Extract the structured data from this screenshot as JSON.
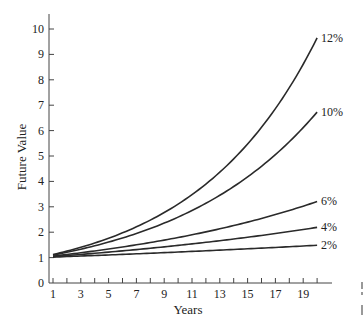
{
  "chart_data": {
    "type": "line",
    "title": "",
    "xlabel": "Years",
    "ylabel": "Future Value",
    "xlim": [
      1,
      20
    ],
    "ylim": [
      0,
      10
    ],
    "grid": false,
    "legend": "inline labels at right end of each curve",
    "x_tick_labels": [
      "1",
      "3",
      "5",
      "7",
      "9",
      "11",
      "13",
      "15",
      "17",
      "19"
    ],
    "y_tick_labels": [
      "0",
      "1",
      "2",
      "3",
      "4",
      "5",
      "6",
      "7",
      "8",
      "9",
      "10"
    ],
    "x": [
      1,
      2,
      3,
      4,
      5,
      6,
      7,
      8,
      9,
      10,
      11,
      12,
      13,
      14,
      15,
      16,
      17,
      18,
      19,
      20
    ],
    "series": [
      {
        "name": "12%",
        "rate": 0.12,
        "values": [
          1.12,
          1.25,
          1.4,
          1.57,
          1.76,
          1.97,
          2.21,
          2.48,
          2.77,
          3.11,
          3.48,
          3.9,
          4.36,
          4.89,
          5.47,
          6.13,
          6.87,
          7.69,
          8.61,
          9.65
        ]
      },
      {
        "name": "10%",
        "rate": 0.1,
        "values": [
          1.1,
          1.21,
          1.33,
          1.46,
          1.61,
          1.77,
          1.95,
          2.14,
          2.36,
          2.59,
          2.85,
          3.14,
          3.45,
          3.8,
          4.18,
          4.59,
          5.05,
          5.56,
          6.12,
          6.73
        ]
      },
      {
        "name": "6%",
        "rate": 0.06,
        "values": [
          1.06,
          1.12,
          1.19,
          1.26,
          1.34,
          1.42,
          1.5,
          1.59,
          1.69,
          1.79,
          1.9,
          2.01,
          2.13,
          2.26,
          2.4,
          2.54,
          2.69,
          2.85,
          3.03,
          3.21
        ]
      },
      {
        "name": "4%",
        "rate": 0.04,
        "values": [
          1.04,
          1.08,
          1.12,
          1.17,
          1.22,
          1.27,
          1.32,
          1.37,
          1.42,
          1.48,
          1.54,
          1.6,
          1.67,
          1.73,
          1.8,
          1.87,
          1.95,
          2.03,
          2.11,
          2.19
        ]
      },
      {
        "name": "2%",
        "rate": 0.02,
        "values": [
          1.02,
          1.04,
          1.06,
          1.08,
          1.1,
          1.13,
          1.15,
          1.17,
          1.2,
          1.22,
          1.24,
          1.27,
          1.29,
          1.32,
          1.35,
          1.37,
          1.4,
          1.43,
          1.46,
          1.49
        ]
      }
    ]
  },
  "colors": {
    "line": "#2a2a2a",
    "axis": "#444444",
    "text": "#222222",
    "background": "#ffffff"
  }
}
